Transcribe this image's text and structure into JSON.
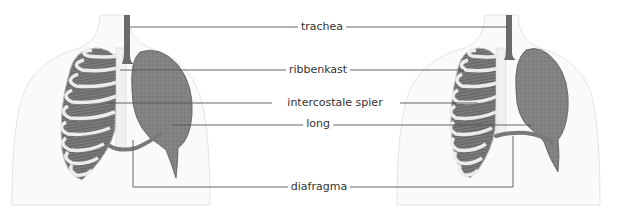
{
  "diagram": {
    "colors": {
      "background": "#ffffff",
      "body_outline": "#e4e4e4",
      "body_fill": "#fafafa",
      "lung": "#7d7d7d",
      "lung_edge": "#5a5a5a",
      "trachea": "#6a6a6a",
      "ribs": "#e8e8e8",
      "rib_outline": "#bdbdbd",
      "intercostal": "#6f6f6f",
      "diaphragm": "#787878",
      "leader_line": "#555555",
      "label_text": "#333333"
    },
    "labels": [
      {
        "id": "trachea",
        "text": "trachea",
        "x": 322,
        "y": 26
      },
      {
        "id": "ribbenkast",
        "text": "ribbenkast",
        "x": 318,
        "y": 70
      },
      {
        "id": "intercostale-spier",
        "text": "intercostale spier",
        "x": 335,
        "y": 103
      },
      {
        "id": "long",
        "text": "long",
        "x": 318,
        "y": 124
      },
      {
        "id": "diafragma",
        "text": "diafragma",
        "x": 313,
        "y": 187
      }
    ],
    "figures": [
      {
        "id": "left-figure",
        "state": "inademing"
      },
      {
        "id": "right-figure",
        "state": "uitademing"
      }
    ]
  }
}
